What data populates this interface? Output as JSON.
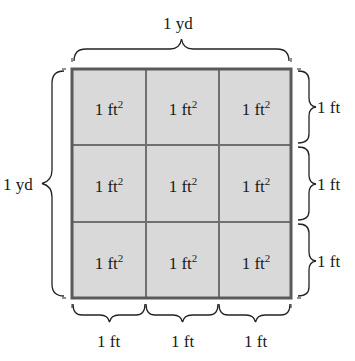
{
  "diagram": {
    "top_label": "1 yd",
    "left_label": "1 yd",
    "cell_unit": "1 ft",
    "cell_exponent": "2",
    "right_labels": [
      "1 ft",
      "1 ft",
      "1 ft"
    ],
    "bottom_labels": [
      "1 ft",
      "1 ft",
      "1 ft"
    ],
    "rows": 3,
    "cols": 3,
    "colors": {
      "fill": "#d9d9d9",
      "grid_line": "#707070",
      "border": "#5a5a5a",
      "brace": "#222222"
    }
  }
}
